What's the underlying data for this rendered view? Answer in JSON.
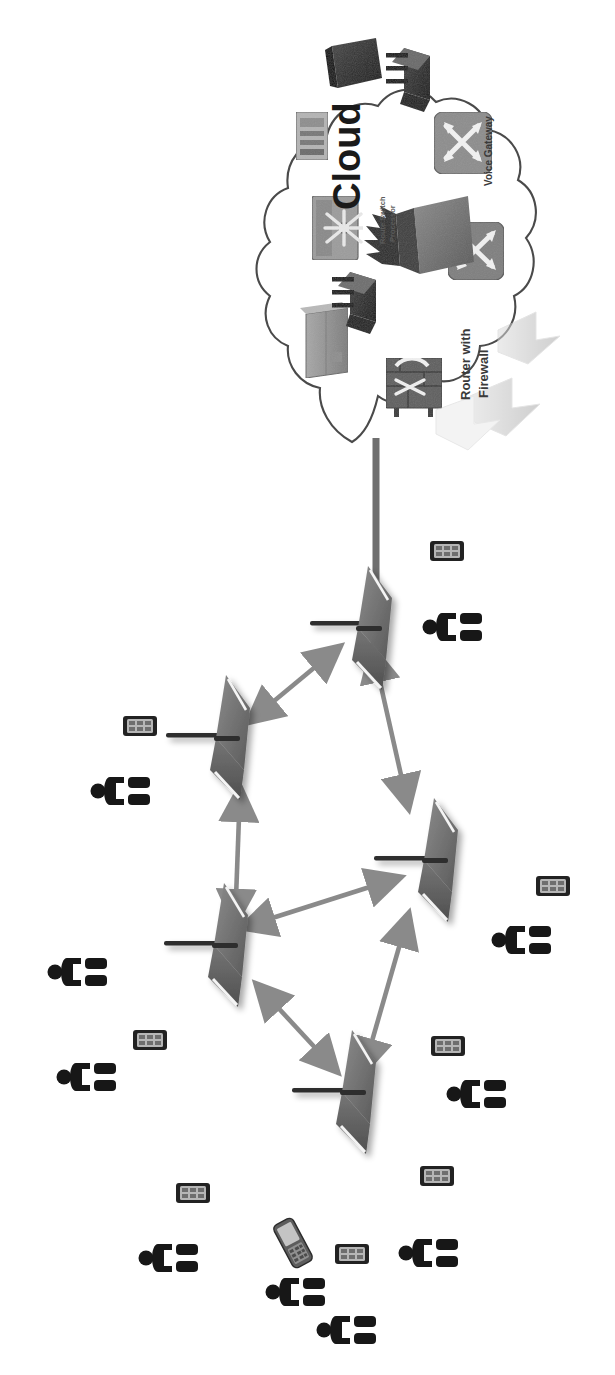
{
  "diagram": {
    "orientation_note": "rotated-90-ccw",
    "background_color": "#ffffff"
  },
  "cloud": {
    "label": "Cloud",
    "label_color": "#1a1a1a",
    "outline_color": "#4a4a4a",
    "fill_color": "#ffffff",
    "components": [
      {
        "id": "cloud-dev-1",
        "name": "wireless-bridge-icon",
        "label": "",
        "color": "#2b2b2b",
        "x": 418,
        "y": 62
      },
      {
        "id": "cloud-dev-2",
        "name": "server-tower-icon",
        "label": "",
        "color": "#3d3d3d",
        "x": 350,
        "y": 60
      },
      {
        "id": "cloud-dev-3",
        "name": "network-switch-icon",
        "label": "",
        "color": "#8a8a8a",
        "x": 311,
        "y": 135
      },
      {
        "id": "cloud-dev-4",
        "name": "route-switch-processor-icon",
        "label": "Route Switch\nProcessor",
        "label_line1": "Route Switch",
        "label_line2": "Processor",
        "color": "#7a7a7a",
        "x": 335,
        "y": 228
      },
      {
        "id": "cloud-dev-5",
        "name": "voice-gateway-icon",
        "label": "Voice Gateway",
        "color": "#7d7d7d",
        "x": 462,
        "y": 143
      },
      {
        "id": "cloud-dev-6",
        "name": "router-icon",
        "label": "",
        "color": "#6e6e6e",
        "x": 470,
        "y": 252
      },
      {
        "id": "cloud-dev-7",
        "name": "multilayer-switch-icon",
        "label": "",
        "color": "#585858",
        "x": 430,
        "y": 232
      },
      {
        "id": "cloud-dev-8",
        "name": "server-block-icon",
        "label": "",
        "color": "#9a9a9a",
        "x": 330,
        "y": 338
      },
      {
        "id": "cloud-dev-9",
        "name": "wireless-bridge-icon",
        "label": "",
        "color": "#2e2e2e",
        "x": 356,
        "y": 290
      },
      {
        "id": "cloud-dev-10",
        "name": "router-with-firewall-icon",
        "label": "Router with\nFirewall",
        "label_line1": "Router with",
        "label_line2": "Firewall",
        "color": "#6a6a6a",
        "x": 412,
        "y": 382
      },
      {
        "id": "cloud-dev-11",
        "name": "firewall-icon",
        "label": "",
        "color": "#555555",
        "x": 434,
        "y": 330
      }
    ],
    "labels": [
      {
        "text": "Voice Gateway",
        "x": 487,
        "y": 185,
        "size": 9
      },
      {
        "text": "Route Switch",
        "x": 383,
        "y": 232,
        "size": 7
      },
      {
        "text": "Processor",
        "x": 393,
        "y": 234,
        "size": 7
      },
      {
        "text": "Router with",
        "x": 468,
        "y": 388,
        "size": 11
      },
      {
        "text": "Firewall",
        "x": 483,
        "y": 390,
        "size": 11
      }
    ]
  },
  "backhaul": {
    "name": "cloud-to-gateway-link",
    "color": "#6f6f6f",
    "from": {
      "x": 376,
      "y": 440
    },
    "to": {
      "x": 376,
      "y": 600
    }
  },
  "mesh": {
    "node_color": "#6b6b6b",
    "node_shadow": "#c9c9c9",
    "antenna_color": "#2f2f2f",
    "link_color": "#8a8a8a",
    "nodes": [
      {
        "id": "ap-1",
        "name": "mesh-gateway-node",
        "x": 369,
        "y": 622,
        "antenna_dir": "left"
      },
      {
        "id": "ap-2",
        "name": "mesh-node",
        "x": 230,
        "y": 730,
        "antenna_dir": "left"
      },
      {
        "id": "ap-3",
        "name": "mesh-node",
        "x": 438,
        "y": 853,
        "antenna_dir": "left"
      },
      {
        "id": "ap-4",
        "name": "mesh-node",
        "x": 228,
        "y": 938,
        "antenna_dir": "left"
      },
      {
        "id": "ap-5",
        "name": "mesh-node",
        "x": 356,
        "y": 1085,
        "antenna_dir": "left"
      }
    ],
    "links": [
      {
        "id": "link-1",
        "name": "mesh-link",
        "from": "ap-2",
        "to": "ap-1",
        "bidirectional": true
      },
      {
        "id": "link-2",
        "name": "mesh-link",
        "from": "ap-1",
        "to": "ap-3",
        "bidirectional": true
      },
      {
        "id": "link-3",
        "name": "mesh-link",
        "from": "ap-4",
        "to": "ap-2",
        "bidirectional": true
      },
      {
        "id": "link-4",
        "name": "mesh-link",
        "from": "ap-4",
        "to": "ap-3",
        "bidirectional": true
      },
      {
        "id": "link-5",
        "name": "mesh-link",
        "from": "ap-5",
        "to": "ap-4",
        "bidirectional": true
      },
      {
        "id": "link-6",
        "name": "mesh-link",
        "from": "ap-5",
        "to": "ap-3",
        "bidirectional": true
      }
    ]
  },
  "clients": {
    "person_color": "#171717",
    "device_color": "#2a2a2a",
    "device_screen_color": "#b8b8b8",
    "people": [
      {
        "id": "person-1",
        "name": "user-icon",
        "x": 450,
        "y": 627
      },
      {
        "id": "person-2",
        "name": "user-icon",
        "x": 118,
        "y": 791
      },
      {
        "id": "person-3",
        "name": "user-icon",
        "x": 75,
        "y": 972
      },
      {
        "id": "person-4",
        "name": "user-icon",
        "x": 519,
        "y": 940
      },
      {
        "id": "person-5",
        "name": "user-icon",
        "x": 84,
        "y": 1077
      },
      {
        "id": "person-6",
        "name": "user-icon",
        "x": 474,
        "y": 1094
      },
      {
        "id": "person-7",
        "name": "user-icon",
        "x": 426,
        "y": 1253
      },
      {
        "id": "person-8",
        "name": "user-icon",
        "x": 166,
        "y": 1258
      },
      {
        "id": "person-9",
        "name": "user-icon",
        "x": 293,
        "y": 1292
      },
      {
        "id": "person-10",
        "name": "user-icon",
        "x": 344,
        "y": 1330
      }
    ],
    "devices": [
      {
        "id": "device-1",
        "name": "smartphone-icon",
        "x": 447,
        "y": 551,
        "kind": "bar"
      },
      {
        "id": "device-2",
        "name": "smartphone-icon",
        "x": 140,
        "y": 726,
        "kind": "bar"
      },
      {
        "id": "device-3",
        "name": "smartphone-icon",
        "x": 553,
        "y": 886,
        "kind": "bar"
      },
      {
        "id": "device-4",
        "name": "smartphone-icon",
        "x": 150,
        "y": 1040,
        "kind": "bar"
      },
      {
        "id": "device-5",
        "name": "smartphone-icon",
        "x": 448,
        "y": 1046,
        "kind": "bar"
      },
      {
        "id": "device-6",
        "name": "smartphone-icon",
        "x": 437,
        "y": 1176,
        "kind": "bar"
      },
      {
        "id": "device-7",
        "name": "smartphone-icon",
        "x": 193,
        "y": 1193,
        "kind": "bar"
      },
      {
        "id": "device-8",
        "name": "smartphone-icon",
        "x": 352,
        "y": 1254,
        "kind": "bar"
      },
      {
        "id": "device-9",
        "name": "flip-phone-icon",
        "x": 293,
        "y": 1243,
        "kind": "flip"
      }
    ]
  }
}
